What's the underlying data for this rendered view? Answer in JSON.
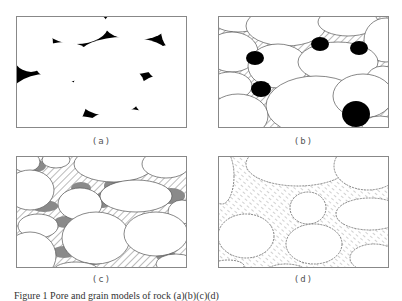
{
  "figure": {
    "caption": "Figure 1   Pore and grain models of rock (a)(b)(c)(d)",
    "panels": [
      {
        "id": "a",
        "label": "(a)",
        "description": "grains (white) with pore space fully black"
      },
      {
        "id": "b",
        "label": "(b)",
        "description": "grains with hatched pore fill and isolated black pores"
      },
      {
        "id": "c",
        "label": "(c)",
        "description": "grains with hatched pore fill and grey residual pores at grain contacts"
      },
      {
        "id": "d",
        "label": "(d)",
        "description": "rounded grains within fine dashed-hatch matrix"
      }
    ]
  },
  "colors": {
    "background": "#ffffff",
    "grain": "#ffffff",
    "pore_black": "#000000",
    "hatch": "#777777",
    "residual_grey": "#8a8a8a",
    "border": "#888888"
  }
}
